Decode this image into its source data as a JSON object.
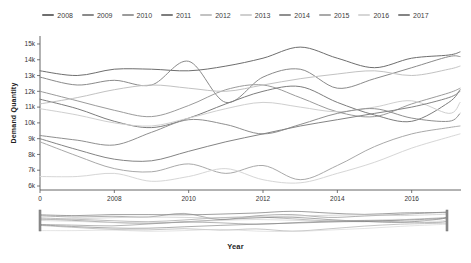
{
  "chart_data": {
    "type": "line",
    "title": "",
    "xlabel": "Year",
    "ylabel": "Demand Quantity",
    "legend_position": "top",
    "grid": false,
    "values_unit": "thousands (k)",
    "x_domain": [
      2006,
      2017.3
    ],
    "y_domain": [
      5.5,
      15.5
    ],
    "x_ticks": [
      {
        "label": "0",
        "year": 2006
      },
      {
        "label": "2008",
        "year": 2008
      },
      {
        "label": "2010",
        "year": 2010
      },
      {
        "label": "2012",
        "year": 2012
      },
      {
        "label": "2014",
        "year": 2014
      },
      {
        "label": "2016",
        "year": 2016
      }
    ],
    "y_ticks": [
      {
        "label": "15k",
        "value": 15
      },
      {
        "label": "14k",
        "value": 14
      },
      {
        "label": "13k",
        "value": 13
      },
      {
        "label": "12k",
        "value": 12
      },
      {
        "label": "11k",
        "value": 11
      },
      {
        "label": "10k",
        "value": 10
      },
      {
        "label": "9k",
        "value": 9
      },
      {
        "label": "8k",
        "value": 8
      },
      {
        "label": "7k",
        "value": 7
      },
      {
        "label": "6k",
        "value": 6
      }
    ],
    "x": [
      2006,
      2007,
      2008,
      2009,
      2010,
      2011,
      2012,
      2013,
      2014,
      2015,
      2016,
      2017,
      2017.3
    ],
    "series": [
      {
        "name": "2008",
        "color": "#6e6e6e",
        "values": [
          13.3,
          13.0,
          13.4,
          13.4,
          13.3,
          13.6,
          14.1,
          14.8,
          14.1,
          13.5,
          14.1,
          14.3,
          14.5
        ]
      },
      {
        "name": "2009",
        "color": "#8a8a8a",
        "values": [
          12.9,
          12.4,
          12.7,
          12.4,
          13.9,
          11.3,
          12.9,
          13.4,
          12.2,
          12.8,
          13.5,
          14.2,
          14.2
        ]
      },
      {
        "name": "2010",
        "color": "#9b9b9b",
        "values": [
          12.0,
          11.4,
          10.8,
          10.4,
          11.1,
          12.1,
          12.4,
          11.6,
          10.7,
          10.4,
          11.2,
          11.9,
          12.2
        ]
      },
      {
        "name": "2011",
        "color": "#7d7d7d",
        "values": [
          11.5,
          10.9,
          10.1,
          9.7,
          10.3,
          11.2,
          12.0,
          12.3,
          11.3,
          10.5,
          10.1,
          11.3,
          12.1
        ]
      },
      {
        "name": "2012",
        "color": "#c2c2c2",
        "values": [
          11.2,
          11.6,
          12.1,
          12.4,
          12.2,
          12.0,
          12.4,
          12.8,
          13.1,
          13.3,
          13.0,
          13.4,
          13.6
        ]
      },
      {
        "name": "2013",
        "color": "#cfcfcf",
        "values": [
          10.9,
          10.5,
          10.0,
          9.8,
          10.3,
          10.9,
          11.3,
          11.0,
          10.7,
          11.0,
          11.4,
          10.6,
          11.3
        ]
      },
      {
        "name": "2014",
        "color": "#8f8f8f",
        "values": [
          9.2,
          8.9,
          8.6,
          9.4,
          10.2,
          9.9,
          9.3,
          9.9,
          10.6,
          10.9,
          10.3,
          10.1,
          10.6
        ]
      },
      {
        "name": "2015",
        "color": "#a9a9a9",
        "values": [
          8.8,
          7.9,
          7.1,
          6.9,
          7.4,
          6.8,
          7.3,
          6.4,
          7.3,
          8.5,
          9.3,
          9.7,
          9.8
        ]
      },
      {
        "name": "2016",
        "color": "#d6d6d6",
        "values": [
          6.6,
          6.6,
          6.8,
          6.3,
          6.6,
          7.1,
          6.4,
          6.2,
          6.8,
          7.5,
          8.4,
          9.1,
          9.3
        ]
      },
      {
        "name": "2017",
        "color": "#848484",
        "values": [
          9.0,
          8.3,
          7.7,
          7.6,
          8.2,
          8.8,
          9.3,
          9.8,
          10.2,
          10.6,
          11.0,
          11.6,
          12.0
        ]
      }
    ]
  },
  "navigator": {
    "xlabel": "Year",
    "brush": {
      "start_year": 2006,
      "end_year": 2017.3,
      "full_range_selected": true
    }
  }
}
